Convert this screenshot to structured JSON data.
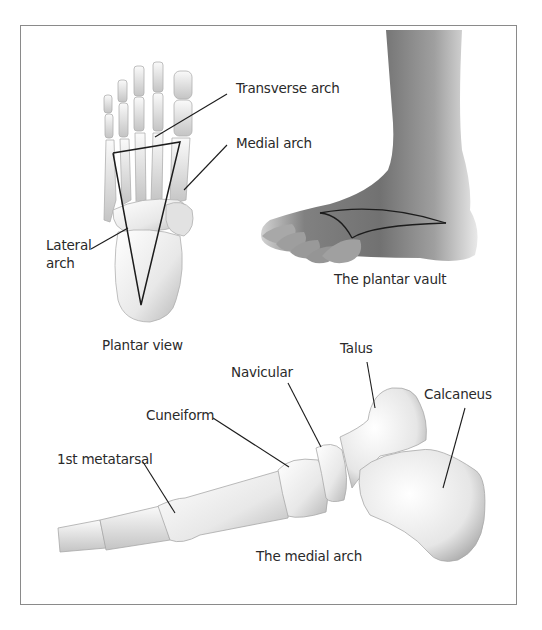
{
  "figure": {
    "panels": [
      {
        "id": "plantar-view",
        "caption": "Plantar view",
        "labels": [
          "Transverse arch",
          "Medial arch",
          "Lateral arch"
        ]
      },
      {
        "id": "plantar-vault",
        "caption": "The plantar vault"
      },
      {
        "id": "medial-arch",
        "caption": "The medial arch",
        "labels": [
          "Talus",
          "Navicular",
          "Cuneiform",
          "Calcaneus",
          "1st metatarsal"
        ]
      }
    ]
  },
  "labels": {
    "transverse_arch": "Transverse arch",
    "medial_arch": "Medial arch",
    "lateral_arch_line1": "Lateral",
    "lateral_arch_line2": "arch",
    "talus": "Talus",
    "navicular": "Navicular",
    "cuneiform": "Cuneiform",
    "calcaneus": "Calcaneus",
    "first_metatarsal": "1st metatarsal"
  },
  "captions": {
    "plantar_view": "Plantar view",
    "plantar_vault": "The plantar vault",
    "medial_arch": "The medial arch"
  },
  "colors": {
    "frame": "#8a8a8a",
    "leader_line": "#222222",
    "bone_light": "#f4f4f4",
    "bone_shade": "#b9b9b9",
    "skin_dark": "#6f6f6f",
    "skin_light": "#d8d8d8"
  }
}
